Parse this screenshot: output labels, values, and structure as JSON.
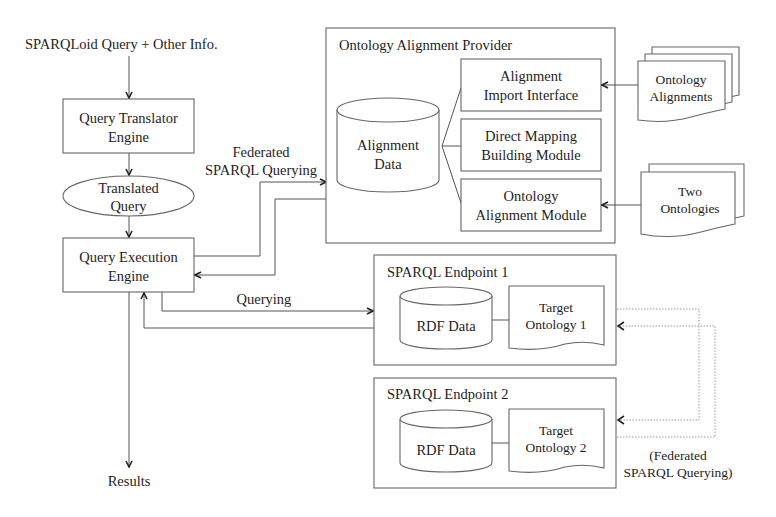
{
  "input_label": "SPARQLoid Query + Other Info.",
  "query_translator": {
    "line1": "Query Translator",
    "line2": "Engine"
  },
  "translated_query": {
    "line1": "Translated",
    "line2": "Query"
  },
  "query_execution": {
    "line1": "Query Execution",
    "line2": "Engine"
  },
  "results_label": "Results",
  "federated_label": {
    "line1": "Federated",
    "line2": "SPARQL Querying"
  },
  "querying_label": "Querying",
  "provider": {
    "title": "Ontology Alignment Provider",
    "alignment_data": {
      "line1": "Alignment",
      "line2": "Data"
    },
    "modules": [
      {
        "line1": "Alignment",
        "line2": "Import Interface"
      },
      {
        "line1": "Direct Mapping",
        "line2": "Building Module"
      },
      {
        "line1": "Ontology",
        "line2": "Alignment Module"
      }
    ]
  },
  "external_docs": {
    "ontology_alignments": {
      "line1": "Ontology",
      "line2": "Alignments"
    },
    "two_ontologies": {
      "line1": "Two",
      "line2": "Ontologies"
    }
  },
  "endpoints": [
    {
      "title": "SPARQL Endpoint 1",
      "data": "RDF Data",
      "onto_line1": "Target",
      "onto_line2": "Ontology 1"
    },
    {
      "title": "SPARQL Endpoint 2",
      "data": "RDF Data",
      "onto_line1": "Target",
      "onto_line2": "Ontology 2"
    }
  ],
  "federated_paren_label": {
    "line1": "(Federated",
    "line2": "SPARQL Querying)"
  }
}
